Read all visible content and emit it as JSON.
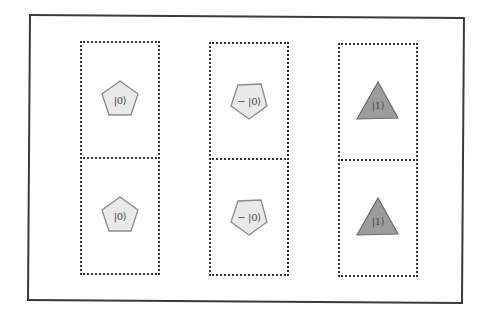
{
  "diagram": {
    "frame": {
      "stroke_color": "#3a3a3a"
    },
    "colors": {
      "pentagon_fill": "#e9e9e9",
      "pentagon_stroke": "#8a8a8a",
      "triangle_fill": "#9c9c9c",
      "triangle_stroke": "#6a6a6a",
      "dash_color": "#333333"
    },
    "columns": [
      {
        "cells": [
          {
            "shape": "pentagon",
            "orientation": "point-up",
            "label": "|0⟩"
          },
          {
            "shape": "pentagon",
            "orientation": "point-up",
            "label": "|0⟩"
          }
        ]
      },
      {
        "cells": [
          {
            "shape": "pentagon",
            "orientation": "point-down",
            "label": "− |0⟩"
          },
          {
            "shape": "pentagon",
            "orientation": "point-down",
            "label": "− |0⟩"
          }
        ]
      },
      {
        "cells": [
          {
            "shape": "triangle",
            "orientation": "point-up",
            "label": "|1⟩"
          },
          {
            "shape": "triangle",
            "orientation": "point-up",
            "label": "|1⟩"
          }
        ]
      }
    ]
  }
}
